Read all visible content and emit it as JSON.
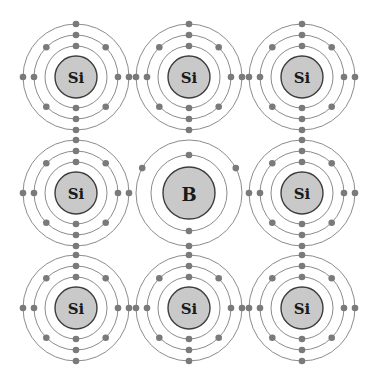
{
  "diagram": {
    "title": "Boron-doped silicon lattice (p-type)",
    "colors": {
      "background": "#ffffff",
      "ring": "#8c8c8c",
      "nucleus_fill": "#c9c9c9",
      "nucleus_stroke": "#3d3d3d",
      "electron": "#7a7a7a",
      "label": "#1a1a1a"
    },
    "grid": {
      "columns_x": [
        76,
        189,
        302
      ],
      "rows_y": [
        77,
        193,
        308
      ]
    },
    "atom_types": {
      "Si": {
        "symbol": "Si",
        "nucleus_radius": 21,
        "label_size": 15,
        "rings": [
          {
            "radius": 31,
            "electron_angles": [
              90,
              270
            ]
          },
          {
            "radius": 42,
            "electron_angles": [
              0,
              45,
              90,
              135,
              180,
              225,
              270,
              315
            ]
          },
          {
            "radius": 53,
            "electron_angles": [
              0,
              90,
              180,
              270
            ]
          }
        ]
      },
      "B": {
        "symbol": "B",
        "nucleus_radius": 26,
        "label_size": 18,
        "rings": [
          {
            "radius": 38,
            "electron_angles": [
              90,
              270
            ]
          },
          {
            "radius": 53,
            "electron_angles": [
              90,
              208,
              332
            ]
          }
        ]
      }
    },
    "atoms": [
      {
        "type": "Si",
        "row": 0,
        "col": 0
      },
      {
        "type": "Si",
        "row": 0,
        "col": 1
      },
      {
        "type": "Si",
        "row": 0,
        "col": 2
      },
      {
        "type": "Si",
        "row": 1,
        "col": 0
      },
      {
        "type": "B",
        "row": 1,
        "col": 1
      },
      {
        "type": "Si",
        "row": 1,
        "col": 2
      },
      {
        "type": "Si",
        "row": 2,
        "col": 0
      },
      {
        "type": "Si",
        "row": 2,
        "col": 1
      },
      {
        "type": "Si",
        "row": 2,
        "col": 2
      }
    ],
    "electron_radius": 3.3
  }
}
